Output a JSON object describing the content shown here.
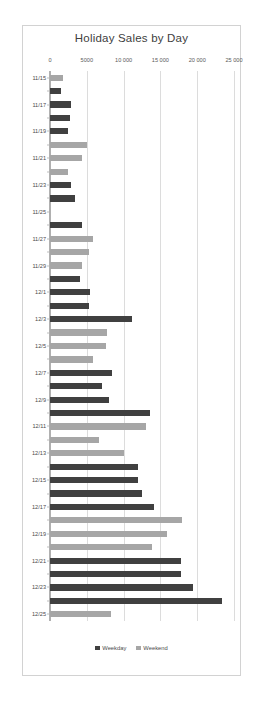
{
  "chart_data": {
    "type": "bar",
    "orientation": "horizontal",
    "title": "Holiday Sales by Day",
    "xlabel": "",
    "ylabel": "",
    "xlim": [
      0,
      25000
    ],
    "xticks": [
      0,
      5000,
      10000,
      15000,
      20000,
      25000
    ],
    "xticklabels": [
      "0",
      "5000",
      "10 000",
      "15 000",
      "20 000",
      "25 000"
    ],
    "grid": true,
    "legend_position": "bottom",
    "legend": [
      {
        "label": "Weekday",
        "color": "#404040"
      },
      {
        "label": "Weekend",
        "color": "#a6a6a6"
      }
    ],
    "categories": [
      "11/15",
      "11/16",
      "11/17",
      "11/18",
      "11/19",
      "11/20",
      "11/21",
      "11/22",
      "11/23",
      "11/24",
      "11/25",
      "11/26",
      "11/27",
      "11/28",
      "11/29",
      "11/30",
      "12/1",
      "12/2",
      "12/3",
      "12/4",
      "12/5",
      "12/6",
      "12/7",
      "12/8",
      "12/9",
      "12/10",
      "12/11",
      "12/12",
      "12/13",
      "12/14",
      "12/15",
      "12/16",
      "12/17",
      "12/18",
      "12/19",
      "12/20",
      "12/21",
      "12/22",
      "12/23",
      "12/24",
      "12/25"
    ],
    "visible_ticklabels": [
      "11/15",
      "11/17",
      "11/19",
      "11/21",
      "11/23",
      "11/25",
      "11/27",
      "11/29",
      "12/1",
      "12/3",
      "12/5",
      "12/7",
      "12/9",
      "12/11",
      "12/13",
      "12/15",
      "12/17",
      "12/19",
      "12/21",
      "12/23",
      "12/25"
    ],
    "values": [
      1700,
      1500,
      2800,
      2700,
      2500,
      5000,
      4400,
      2400,
      2900,
      3400,
      0,
      4400,
      5900,
      5300,
      4400,
      4100,
      5500,
      5300,
      11200,
      7800,
      7600,
      5800,
      8400,
      7100,
      8000,
      13600,
      13000,
      6600,
      10000,
      11900,
      12000,
      12500,
      14100,
      17900,
      15900,
      13900,
      17800,
      17800,
      19400,
      23400,
      8300
    ],
    "series": [
      {
        "name": "Weekday",
        "color": "#404040"
      },
      {
        "name": "Weekend",
        "color": "#a6a6a6"
      }
    ],
    "point_series": [
      "Weekend",
      "Weekday",
      "Weekday",
      "Weekday",
      "Weekday",
      "Weekend",
      "Weekend",
      "Weekend",
      "Weekday",
      "Weekday",
      "Weekday",
      "Weekday",
      "Weekend",
      "Weekend",
      "Weekend",
      "Weekday",
      "Weekday",
      "Weekday",
      "Weekday",
      "Weekend",
      "Weekend",
      "Weekend",
      "Weekday",
      "Weekday",
      "Weekday",
      "Weekday",
      "Weekend",
      "Weekend",
      "Weekend",
      "Weekday",
      "Weekday",
      "Weekday",
      "Weekday",
      "Weekend",
      "Weekend",
      "Weekend",
      "Weekday",
      "Weekday",
      "Weekday",
      "Weekday",
      "Weekend"
    ]
  }
}
